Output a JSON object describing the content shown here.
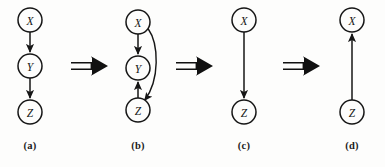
{
  "figure": {
    "background_color": "#fdfdfc",
    "ink_color": "#161616",
    "connector_symbol": "⟹",
    "connector_name": "implies-arrow"
  },
  "panels": [
    {
      "id": "a",
      "caption": "(a)",
      "nodes": [
        {
          "id": "X",
          "label": "X",
          "cx": 30,
          "cy": 20,
          "r": 12
        },
        {
          "id": "Y",
          "label": "Y",
          "cx": 30,
          "cy": 66,
          "r": 12
        },
        {
          "id": "Z",
          "label": "Z",
          "cx": 30,
          "cy": 112,
          "r": 12
        }
      ],
      "edges": [
        {
          "from": "X",
          "to": "Y",
          "type": "straight",
          "direction": "down"
        },
        {
          "from": "Y",
          "to": "Z",
          "type": "straight",
          "direction": "down"
        }
      ]
    },
    {
      "id": "b",
      "caption": "(b)",
      "nodes": [
        {
          "id": "X",
          "label": "X",
          "cx": 30,
          "cy": 22,
          "r": 12
        },
        {
          "id": "Y",
          "label": "Y",
          "cx": 30,
          "cy": 68,
          "r": 12
        },
        {
          "id": "Z",
          "label": "Z",
          "cx": 30,
          "cy": 110,
          "r": 12
        }
      ],
      "edges": [
        {
          "from": "X",
          "to": "Y",
          "type": "straight",
          "direction": "down"
        },
        {
          "from": "Z",
          "to": "Y",
          "type": "straight",
          "direction": "up"
        },
        {
          "from": "X",
          "to": "Z",
          "type": "curved",
          "direction": "down",
          "bulge": "right"
        }
      ]
    },
    {
      "id": "c",
      "caption": "(c)",
      "nodes": [
        {
          "id": "X",
          "label": "X",
          "cx": 30,
          "cy": 20,
          "r": 12
        },
        {
          "id": "Z",
          "label": "Z",
          "cx": 30,
          "cy": 112,
          "r": 12
        }
      ],
      "edges": [
        {
          "from": "X",
          "to": "Z",
          "type": "straight",
          "direction": "down"
        }
      ]
    },
    {
      "id": "d",
      "caption": "(d)",
      "nodes": [
        {
          "id": "X",
          "label": "X",
          "cx": 30,
          "cy": 20,
          "r": 12
        },
        {
          "id": "Z",
          "label": "Z",
          "cx": 30,
          "cy": 112,
          "r": 12
        }
      ],
      "edges": [
        {
          "from": "Z",
          "to": "X",
          "type": "straight",
          "direction": "up"
        }
      ]
    }
  ],
  "connectors": [
    {
      "id": "connector-1",
      "between": "a-b",
      "symbol": "⟹"
    },
    {
      "id": "connector-2",
      "between": "b-c",
      "symbol": "⟹"
    },
    {
      "id": "connector-3",
      "between": "c-d",
      "symbol": "⟹"
    }
  ]
}
